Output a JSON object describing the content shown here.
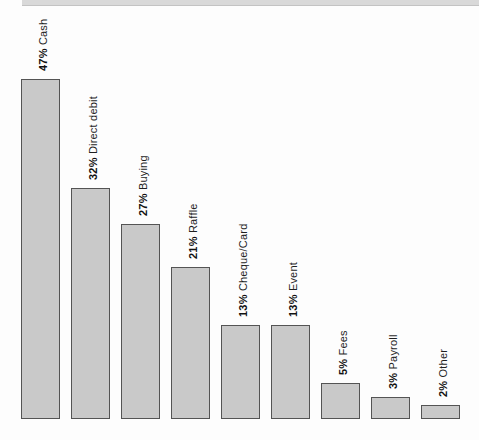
{
  "top_band": {
    "color": "#d9d9d9"
  },
  "chart_data": {
    "type": "bar",
    "title": "",
    "xlabel": "",
    "ylabel": "",
    "unit": "%",
    "categories": [
      "Cash",
      "Direct debit",
      "Buying",
      "Raffle",
      "Cheque/Card",
      "Event",
      "Fees",
      "Payroll",
      "Other"
    ],
    "values": [
      47,
      32,
      27,
      21,
      13,
      13,
      5,
      3,
      2
    ],
    "bar_labels": [
      "47% Cash",
      "32% Direct debit",
      "27% Buying",
      "21% Raffle",
      "13% Cheque/Card",
      "13% Event",
      "5% Fees",
      "3% Payroll",
      "2% Other"
    ],
    "ylim": [
      0,
      50
    ],
    "grid": false,
    "legend": null,
    "label_style": {
      "rotation_deg": 90,
      "percent_bold": true
    },
    "colors": {
      "bar_fill": "#c9c9c9",
      "bar_border": "#545454",
      "label_text": "#1f1f1f",
      "label_percent": "#111111"
    }
  }
}
